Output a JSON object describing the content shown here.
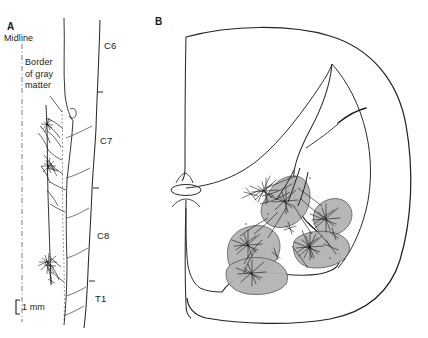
{
  "figure": {
    "background_color": "#ffffff",
    "ink_color": "#1a1a1a",
    "nucleus_fill_color": "#b3b3b3",
    "panels": [
      {
        "id": "A",
        "letter": "A",
        "name": "longitudinal-view",
        "annotations": {
          "midline_label": "Midline",
          "gray_matter_border_label": "Border\nof gray\nmatter"
        },
        "segment_labels": [
          {
            "text": "C6",
            "y": 46
          },
          {
            "text": "C7",
            "y": 141
          },
          {
            "text": "C8",
            "y": 236
          },
          {
            "text": "T1",
            "y": 299
          }
        ],
        "segment_ticks": [
          {
            "y": 92
          },
          {
            "y": 188
          },
          {
            "y": 281
          }
        ],
        "scale_bar": {
          "label": "1 mm",
          "length_px": 14
        }
      },
      {
        "id": "B",
        "letter": "B",
        "name": "transverse-section-view",
        "features": {
          "central_canal": "central-canal",
          "motor_nuclei": "shaded-motor-nuclei",
          "arborizations": "axon-terminal-arborizations"
        }
      }
    ]
  }
}
